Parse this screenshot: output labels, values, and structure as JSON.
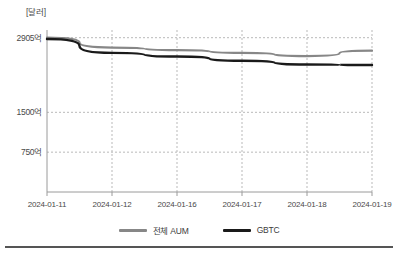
{
  "chart_data": {
    "type": "line",
    "title": "",
    "subtitle": "",
    "xlabel": "",
    "ylabel": "[달러]",
    "unit_label": "[달러]",
    "grid": true,
    "legend_position": "bottom",
    "x": [
      "2024-01-11",
      "2024-01-12",
      "2024-01-16",
      "2024-01-17",
      "2024-01-18",
      "2024-01-19"
    ],
    "xtick_labels": [
      "2024-01-11",
      "2024-01-12",
      "2024-01-16",
      "2024-01-17",
      "2024-01-18",
      "2024-01-19"
    ],
    "ytick_labels": [
      "2905억",
      "1500억",
      "750억"
    ],
    "ytick_values": [
      290500000000,
      150000000000,
      75000000000
    ],
    "ylim": [
      0,
      305000000000
    ],
    "series": [
      {
        "name": "전체 AUM",
        "color": "#878787",
        "values": [
          290500000000,
          272000000000,
          267000000000,
          262000000000,
          256000000000,
          266000000000
        ]
      },
      {
        "name": "GBTC",
        "color": "#1a1a1a",
        "values": [
          288000000000,
          262000000000,
          255000000000,
          247000000000,
          240000000000,
          239000000000
        ]
      }
    ]
  },
  "legend": {
    "items": [
      {
        "label": "전체 AUM",
        "color": "#878787"
      },
      {
        "label": "GBTC",
        "color": "#1a1a1a"
      }
    ]
  }
}
